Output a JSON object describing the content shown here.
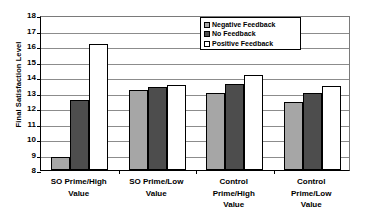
{
  "chart_data": {
    "type": "bar",
    "title": "",
    "xlabel": "",
    "ylabel": "Final Satisfaction Level",
    "ylim": [
      8,
      18
    ],
    "ytick_step": 1,
    "yticks": [
      18,
      17,
      16,
      15,
      14,
      13,
      12,
      11,
      10,
      9,
      8
    ],
    "grid": true,
    "legend_position": "top-center",
    "categories": [
      "SO Prime/High Value",
      "SO Prime/Low Value",
      "Control Prime/High Value",
      "Control Prime/Low Value"
    ],
    "category_lines": [
      [
        "SO Prime/High",
        "Value"
      ],
      [
        "SO Prime/Low",
        "Value"
      ],
      [
        "Control",
        "Prime/High",
        "Value"
      ],
      [
        "Control",
        "Prime/Low",
        "Value"
      ]
    ],
    "series": [
      {
        "name": "Negative Feedback",
        "color": "#a6a6a6",
        "values": [
          8.85,
          13.15,
          12.95,
          12.4
        ]
      },
      {
        "name": "No Feedback",
        "color": "#4d4d4d",
        "values": [
          12.5,
          13.35,
          13.55,
          12.95
        ]
      },
      {
        "name": "Positive Feedback",
        "color": "#ffffff",
        "values": [
          16.1,
          13.5,
          14.1,
          13.45
        ]
      }
    ]
  },
  "axis": {
    "line_color": "#000000",
    "grid_color": "#8c8c8c"
  }
}
